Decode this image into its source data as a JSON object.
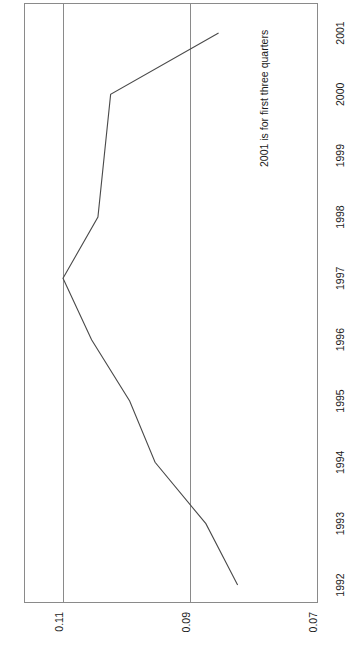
{
  "chart_data": {
    "type": "line",
    "title": "",
    "subtitle": "",
    "xlabel": "",
    "ylabel": "",
    "orientation": "rotated-90-ccw",
    "grid": true,
    "legend": "none",
    "categories": [
      "1992",
      "1993",
      "1994",
      "1995",
      "1996",
      "1997",
      "1998",
      "1999",
      "2000",
      "2001"
    ],
    "values": [
      0.0825,
      0.0875,
      0.0955,
      0.0995,
      0.1055,
      0.11,
      0.1045,
      0.1035,
      0.1025,
      0.0855
    ],
    "value_axis": {
      "ticks": [
        "0.11",
        "0.09",
        "0.07"
      ],
      "tick_values": [
        0.11,
        0.09,
        0.07
      ],
      "lim": [
        0.07,
        0.115
      ],
      "reversed": true
    },
    "category_axis": {
      "ticks": [
        "1992",
        "1993",
        "1994",
        "1995",
        "1996",
        "1997",
        "1998",
        "1999",
        "2000",
        "2001"
      ]
    },
    "annotations": [
      {
        "text": "2001 is for first three quarters"
      }
    ],
    "colors": {
      "line": "#4a4a4a",
      "grid": "#8a8a8a",
      "border": "#8a8a8a",
      "text": "#1a1a1a",
      "background": "#ffffff"
    }
  }
}
